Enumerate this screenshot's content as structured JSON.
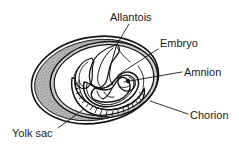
{
  "figure": {
    "background_color": "#ffffff",
    "ink_color": "#141414",
    "shell_fill_color": "#b4b4b4",
    "membrane_fill_color": "#d2d2d2",
    "interior_fill_color": "#ffffff"
  },
  "labels": [
    {
      "id": "allantois",
      "text": "Allantois",
      "text_x": 110,
      "text_y": 21,
      "anchor": "start",
      "leader": "M129,24 L116,46"
    },
    {
      "id": "embryo",
      "text": "Embryo",
      "text_x": 160,
      "text_y": 47,
      "anchor": "start",
      "leader": "M158,49 L118,75"
    },
    {
      "id": "amnion",
      "text": "Amnion",
      "text_x": 184,
      "text_y": 76,
      "anchor": "start",
      "leader": "M182,72 L124,82"
    },
    {
      "id": "chorion",
      "text": "Chorion",
      "text_x": 190,
      "text_y": 119,
      "anchor": "start",
      "leader": "M188,114 L150,101"
    },
    {
      "id": "yolk-sac",
      "text": "Yolk sac",
      "text_x": 12,
      "text_y": 137,
      "anchor": "start",
      "leader": "M58,128 L84,109"
    }
  ],
  "structures": [
    {
      "id": "shell",
      "name": "egg shell outer wall"
    },
    {
      "id": "chorion-membrane",
      "name": "chorion membrane band"
    },
    {
      "id": "allantois-sac",
      "name": "allantois sac"
    },
    {
      "id": "amnion-membrane",
      "name": "amnion membrane"
    },
    {
      "id": "embryo-body",
      "name": "embryo body"
    },
    {
      "id": "yolk-sac-body",
      "name": "yolk sac"
    }
  ]
}
